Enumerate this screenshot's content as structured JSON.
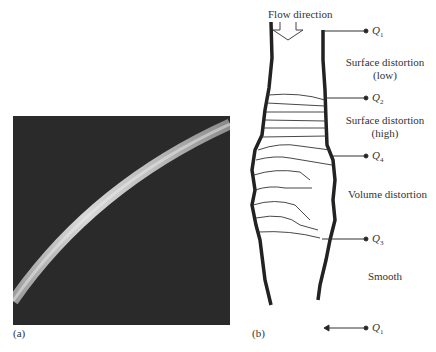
{
  "figure": {
    "panel_a": {
      "label": "(a)",
      "description": "photograph of a curved tube against dark background"
    },
    "panel_b": {
      "label": "(b)",
      "flow_label": "Flow direction",
      "regions": [
        {
          "line1": "Surface distortion",
          "line2": "(low)"
        },
        {
          "line1": "Surface distortion",
          "line2": "(high)"
        },
        {
          "line1": "Volume distortion",
          "line2": ""
        },
        {
          "line1": "Smooth",
          "line2": ""
        }
      ],
      "markers": [
        {
          "sym": "Q",
          "sub": "1"
        },
        {
          "sym": "Q",
          "sub": "2"
        },
        {
          "sym": "Q",
          "sub": "4"
        },
        {
          "sym": "Q",
          "sub": "3"
        },
        {
          "sym": "Q",
          "sub": "1"
        }
      ]
    }
  }
}
